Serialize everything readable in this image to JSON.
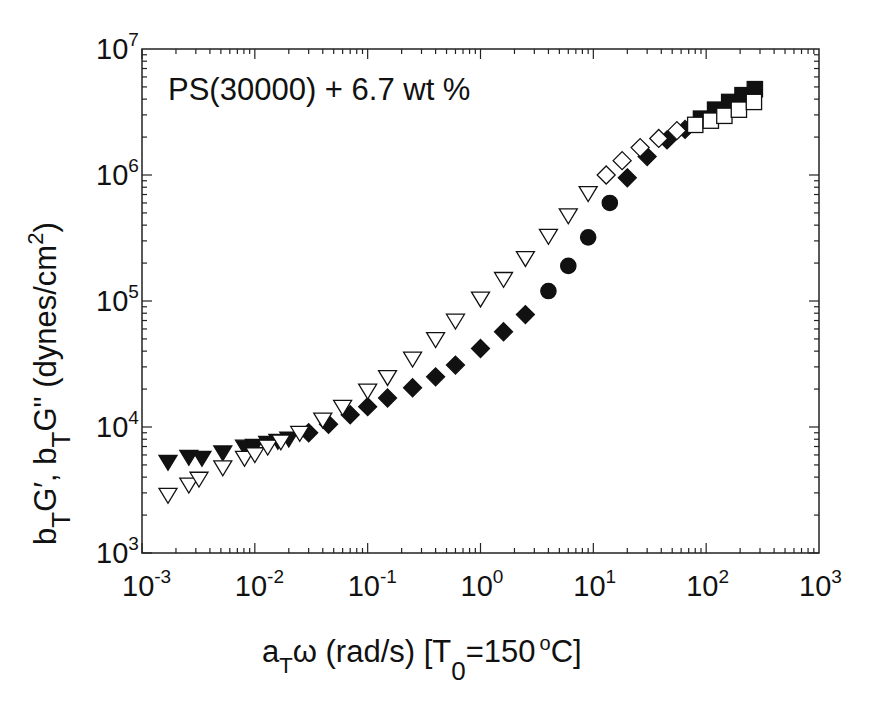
{
  "chart_data": {
    "type": "scatter",
    "title": "",
    "annotation": "PS(30000) + 6.7 wt %",
    "xlabel": "a_T ω (rad/s) [T_0 = 150 °C]",
    "ylabel": "b_T G', b_T G\" (dynes/cm^2)",
    "xscale": "log",
    "yscale": "log",
    "xlim": [
      0.001,
      1000
    ],
    "ylim": [
      1000,
      10000000
    ],
    "grid": false,
    "legend": "none",
    "x_ticks": [
      "10^-3",
      "10^-2",
      "10^-1",
      "10^0",
      "10^1",
      "10^2",
      "10^3"
    ],
    "y_ticks": [
      "10^3",
      "10^4",
      "10^5",
      "10^6",
      "10^7"
    ],
    "series": [
      {
        "name": "b_T G' (filled symbols)",
        "filled": true,
        "points": [
          {
            "x": 0.0017,
            "y": 5300,
            "marker": "triangle-down"
          },
          {
            "x": 0.0026,
            "y": 5800,
            "marker": "triangle-down"
          },
          {
            "x": 0.0034,
            "y": 5700,
            "marker": "triangle-down"
          },
          {
            "x": 0.0052,
            "y": 6300,
            "marker": "triangle-down"
          },
          {
            "x": 0.0081,
            "y": 7000,
            "marker": "triangle-down"
          },
          {
            "x": 0.0099,
            "y": 7100,
            "marker": "triangle-down"
          },
          {
            "x": 0.013,
            "y": 7500,
            "marker": "triangle-down"
          },
          {
            "x": 0.016,
            "y": 7800,
            "marker": "triangle-down"
          },
          {
            "x": 0.02,
            "y": 8100,
            "marker": "triangle-down"
          },
          {
            "x": 0.03,
            "y": 9000,
            "marker": "diamond"
          },
          {
            "x": 0.045,
            "y": 10500,
            "marker": "diamond"
          },
          {
            "x": 0.07,
            "y": 12500,
            "marker": "diamond"
          },
          {
            "x": 0.1,
            "y": 14500,
            "marker": "diamond"
          },
          {
            "x": 0.15,
            "y": 17000,
            "marker": "diamond"
          },
          {
            "x": 0.25,
            "y": 20500,
            "marker": "diamond"
          },
          {
            "x": 0.4,
            "y": 25000,
            "marker": "diamond"
          },
          {
            "x": 0.6,
            "y": 31000,
            "marker": "diamond"
          },
          {
            "x": 1.0,
            "y": 42000,
            "marker": "diamond"
          },
          {
            "x": 1.6,
            "y": 57000,
            "marker": "diamond"
          },
          {
            "x": 2.5,
            "y": 78000,
            "marker": "diamond"
          },
          {
            "x": 4.0,
            "y": 120000,
            "marker": "circle"
          },
          {
            "x": 6.0,
            "y": 190000,
            "marker": "circle"
          },
          {
            "x": 9.0,
            "y": 320000,
            "marker": "circle"
          },
          {
            "x": 14,
            "y": 600000,
            "marker": "circle"
          },
          {
            "x": 20,
            "y": 950000,
            "marker": "diamond"
          },
          {
            "x": 30,
            "y": 1400000,
            "marker": "diamond"
          },
          {
            "x": 45,
            "y": 1900000,
            "marker": "diamond"
          },
          {
            "x": 65,
            "y": 2300000,
            "marker": "diamond"
          },
          {
            "x": 90,
            "y": 2800000,
            "marker": "square"
          },
          {
            "x": 120,
            "y": 3300000,
            "marker": "square"
          },
          {
            "x": 160,
            "y": 3800000,
            "marker": "square"
          },
          {
            "x": 210,
            "y": 4300000,
            "marker": "square"
          },
          {
            "x": 270,
            "y": 4800000,
            "marker": "square"
          }
        ]
      },
      {
        "name": "b_T G\" (open symbols)",
        "filled": false,
        "points": [
          {
            "x": 0.0017,
            "y": 2900,
            "marker": "triangle-down"
          },
          {
            "x": 0.0026,
            "y": 3500,
            "marker": "triangle-down"
          },
          {
            "x": 0.0032,
            "y": 3900,
            "marker": "triangle-down"
          },
          {
            "x": 0.0052,
            "y": 4800,
            "marker": "triangle-down"
          },
          {
            "x": 0.0081,
            "y": 5700,
            "marker": "triangle-down"
          },
          {
            "x": 0.01,
            "y": 6100,
            "marker": "triangle-down"
          },
          {
            "x": 0.013,
            "y": 7000,
            "marker": "triangle-down"
          },
          {
            "x": 0.017,
            "y": 7700,
            "marker": "triangle-down"
          },
          {
            "x": 0.025,
            "y": 9000,
            "marker": "triangle-down"
          },
          {
            "x": 0.04,
            "y": 11500,
            "marker": "triangle-down"
          },
          {
            "x": 0.06,
            "y": 14500,
            "marker": "triangle-down"
          },
          {
            "x": 0.1,
            "y": 19500,
            "marker": "triangle-down"
          },
          {
            "x": 0.15,
            "y": 25000,
            "marker": "triangle-down"
          },
          {
            "x": 0.25,
            "y": 35000,
            "marker": "triangle-down"
          },
          {
            "x": 0.4,
            "y": 50000,
            "marker": "triangle-down"
          },
          {
            "x": 0.6,
            "y": 70000,
            "marker": "triangle-down"
          },
          {
            "x": 1.0,
            "y": 105000,
            "marker": "triangle-down"
          },
          {
            "x": 1.6,
            "y": 150000,
            "marker": "triangle-down"
          },
          {
            "x": 2.5,
            "y": 220000,
            "marker": "triangle-down"
          },
          {
            "x": 4.0,
            "y": 330000,
            "marker": "triangle-down"
          },
          {
            "x": 6.0,
            "y": 480000,
            "marker": "triangle-down"
          },
          {
            "x": 9.0,
            "y": 720000,
            "marker": "triangle-down"
          },
          {
            "x": 13,
            "y": 1000000,
            "marker": "diamond"
          },
          {
            "x": 18,
            "y": 1300000,
            "marker": "diamond"
          },
          {
            "x": 26,
            "y": 1650000,
            "marker": "diamond"
          },
          {
            "x": 38,
            "y": 1950000,
            "marker": "diamond"
          },
          {
            "x": 55,
            "y": 2250000,
            "marker": "diamond"
          },
          {
            "x": 80,
            "y": 2500000,
            "marker": "square"
          },
          {
            "x": 110,
            "y": 2700000,
            "marker": "square"
          },
          {
            "x": 145,
            "y": 2950000,
            "marker": "square"
          },
          {
            "x": 195,
            "y": 3300000,
            "marker": "square"
          },
          {
            "x": 265,
            "y": 3800000,
            "marker": "square"
          }
        ]
      }
    ]
  },
  "labels": {
    "annotation": "PS(30000) + 6.7 wt %",
    "x_ticks": [
      {
        "base": "10",
        "exp": "-3"
      },
      {
        "base": "10",
        "exp": "-2"
      },
      {
        "base": "10",
        "exp": "-1"
      },
      {
        "base": "10",
        "exp": "0"
      },
      {
        "base": "10",
        "exp": "1"
      },
      {
        "base": "10",
        "exp": "2"
      },
      {
        "base": "10",
        "exp": "3"
      }
    ],
    "y_ticks": [
      {
        "base": "10",
        "exp": "3"
      },
      {
        "base": "10",
        "exp": "4"
      },
      {
        "base": "10",
        "exp": "5"
      },
      {
        "base": "10",
        "exp": "6"
      },
      {
        "base": "10",
        "exp": "7"
      }
    ],
    "xlabel": {
      "a": "a",
      "a_sub": "T",
      "omega": "ω (rad/s) [T",
      "t_sub": "0",
      "eq": "=150",
      "deg": "o",
      "unit": "C]"
    },
    "ylabel": {
      "b1": "b",
      "b1_sub": "T",
      "g1": "G′, b",
      "b2_sub": "T",
      "g2": "G\" (dynes/cm",
      "sup": "2",
      "close": ")"
    }
  }
}
